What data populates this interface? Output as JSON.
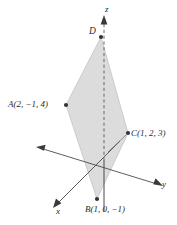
{
  "figure": {
    "background_color": "#ffffff",
    "plane_fill_color": "#dcdcdc",
    "plane_stroke_color": "#b9b9b9",
    "axis_color": "#3a3a3a",
    "point_color": "#333333",
    "axes": [
      {
        "name": "x-axis",
        "label": "x",
        "label_x": 56,
        "label_y": 207
      },
      {
        "name": "y-axis",
        "label": "y",
        "label_x": 162,
        "label_y": 180
      },
      {
        "name": "z-axis",
        "label": "z",
        "label_x": 105,
        "label_y": 5
      }
    ],
    "points": [
      {
        "id": "A",
        "name": "point-a",
        "label": "A(2, −1, 4)",
        "letter": "A",
        "coords": "(2, −1, 4)",
        "marker_x": 66,
        "marker_y": 105,
        "label_x": 8,
        "label_y": 100
      },
      {
        "id": "C",
        "name": "point-c",
        "label": "C(1, 2, 3)",
        "letter": "C",
        "coords": "(1, 2, 3)",
        "marker_x": 128,
        "marker_y": 133,
        "label_x": 131,
        "label_y": 129
      },
      {
        "id": "B",
        "name": "point-b",
        "label": "B(1, 0, −1)",
        "letter": "B",
        "coords": "(1, 0, −1)",
        "marker_x": 97,
        "marker_y": 199,
        "label_x": 85,
        "label_y": 205
      },
      {
        "id": "D",
        "name": "point-d",
        "label": "D",
        "letter": "D",
        "coords": "",
        "marker_x": 101,
        "marker_y": 37,
        "label_x": 89,
        "label_y": 27
      }
    ],
    "plane_vertices": [
      {
        "x": 101,
        "y": 37
      },
      {
        "x": 128,
        "y": 133
      },
      {
        "x": 97,
        "y": 199
      },
      {
        "x": 66,
        "y": 105
      }
    ]
  }
}
